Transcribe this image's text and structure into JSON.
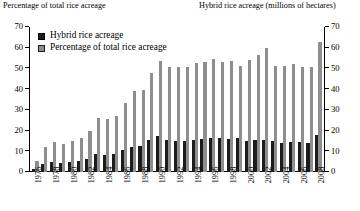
{
  "chart_data": {
    "type": "bar",
    "title": "",
    "left_axis_title": "Percentage of total rice acreage",
    "right_axis_title": "Hybrid rice acreage (millions of hectares)",
    "xlabel": "",
    "ylabel": "Percentage of total rice acreage",
    "ylim": [
      0,
      70
    ],
    "yticks": [
      0,
      10,
      20,
      30,
      40,
      50,
      60,
      70
    ],
    "right_ylim": [
      0,
      70
    ],
    "right_yticks": [
      0,
      10,
      20,
      30,
      40,
      50,
      60,
      70
    ],
    "grid": false,
    "legend_position": "top-left",
    "categories": [
      "1976",
      "1977",
      "1978",
      "1979",
      "1980",
      "1981",
      "1982",
      "1983",
      "1984",
      "1985",
      "1986",
      "1987",
      "1988",
      "1989",
      "1990",
      "1991",
      "1992",
      "1993",
      "1994",
      "1995",
      "1996",
      "1997",
      "1998",
      "1999",
      "2000",
      "2001",
      "2002",
      "2003",
      "2004",
      "2005",
      "2006",
      "2007",
      "2008"
    ],
    "tick_labels": [
      "1976",
      "",
      "1978",
      "",
      "1980",
      "",
      "1982",
      "",
      "1984",
      "",
      "1986",
      "",
      "1988",
      "",
      "1990",
      "",
      "1992",
      "",
      "1994",
      "",
      "1996",
      "",
      "1998",
      "",
      "2000",
      "",
      "2002",
      "",
      "2004",
      "",
      "2006",
      "",
      "2008"
    ],
    "series": [
      {
        "name": "Hybrid rice acreage",
        "unit": "millions of hectares",
        "color": "#1c1c1c",
        "values": [
          1.4,
          4.0,
          4.6,
          4.3,
          4.7,
          5.2,
          6.3,
          8.8,
          8.1,
          8.7,
          10.5,
          12.1,
          12.8,
          15.6,
          17.2,
          15.3,
          14.8,
          14.9,
          15.5,
          16.0,
          16.6,
          16.4,
          15.9,
          16.3,
          15.1,
          15.3,
          15.5,
          15.2,
          13.9,
          14.5,
          14.7,
          13.9,
          17.8
        ]
      },
      {
        "name": "Percentage of total rice acreage",
        "unit": "percent",
        "color": "#8e8e8e",
        "values": [
          5.2,
          12.0,
          14.3,
          13.7,
          14.8,
          16.4,
          19.7,
          26.2,
          25.6,
          27.0,
          33.4,
          39.0,
          39.5,
          48.0,
          53.7,
          50.6,
          50.7,
          50.8,
          52.6,
          53.0,
          54.5,
          52.9,
          53.6,
          51.0,
          54.2,
          56.5,
          59.7,
          51.4,
          51.2,
          52.1,
          50.5,
          50.6,
          63.0
        ]
      }
    ]
  },
  "legend": {
    "items": [
      {
        "label": "Hybrid rice acreage",
        "swatch": "dark"
      },
      {
        "label": "Percentage of total rice acreage",
        "swatch": "grey"
      }
    ]
  }
}
